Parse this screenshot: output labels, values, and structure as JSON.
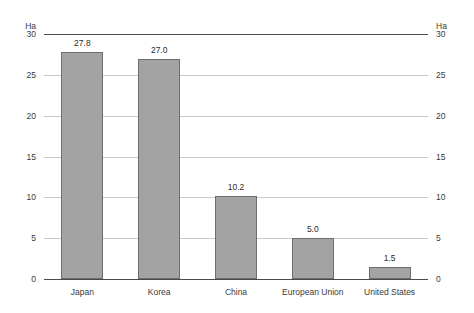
{
  "chart_data": {
    "type": "bar",
    "title": "",
    "subtitle": "",
    "xlabel": "",
    "ylabel": "Ha",
    "ylabel_right": "Ha",
    "unit": "Ha",
    "categories": [
      "Japan",
      "Korea",
      "China",
      "European Union",
      "United States"
    ],
    "values": [
      27.8,
      27.0,
      10.2,
      5.0,
      1.5
    ],
    "value_labels": [
      "27.8",
      "27.0",
      "10.2",
      "5.0",
      "1.5"
    ],
    "ylim": [
      0,
      30
    ],
    "yticks": [
      30,
      25,
      20,
      15,
      10,
      5,
      0
    ],
    "ytick_labels": [
      "30",
      "25",
      "20",
      "15",
      "10",
      "5",
      "0"
    ],
    "grid": true,
    "grid_axis": "y",
    "legend": false,
    "dual_axis": true,
    "series": [
      {
        "name": "",
        "values": [
          27.8,
          27.0,
          10.2,
          5.0,
          1.5
        ]
      }
    ],
    "colors": {
      "bar_fill": "#a3a3a3",
      "bar_border": "#6e6e6e",
      "gridline": "#c9c9c9",
      "axis_line": "#4a4a4a",
      "background": "#ffffff",
      "text": "#3a3a3a"
    }
  }
}
